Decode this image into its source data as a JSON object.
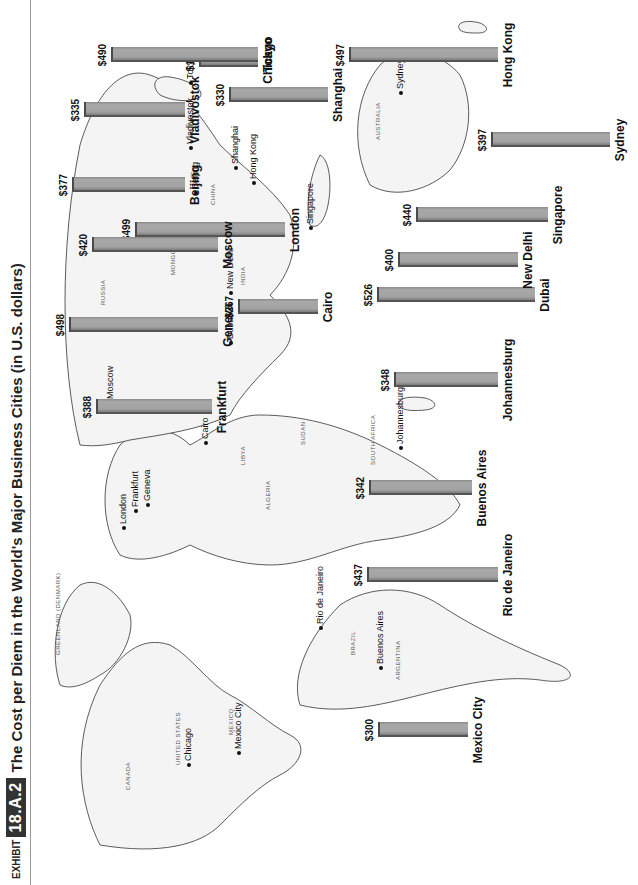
{
  "header": {
    "exhibit_prefix": "EXHIBIT",
    "exhibit_number": "18.A.2",
    "title": "The Cost per Diem in the World's Major Business Cities (in U.S. dollars)"
  },
  "chart_data": {
    "type": "bar",
    "title": "The Cost per Diem in the World's Major Business Cities (in U.S. dollars)",
    "xlabel": "",
    "ylabel": "Cost per diem (US$)",
    "categories": [
      "Chicago",
      "Mexico City",
      "London",
      "Rio de Janeiro",
      "Cairo",
      "Buenos Aires",
      "Frankfurt",
      "Johannesburg",
      "Geneva",
      "Dubai",
      "Moscow",
      "New Delhi",
      "Beijing",
      "Singapore",
      "Vladivostok",
      "Shanghai",
      "Tokyo",
      "Hong Kong",
      "Sydney"
    ],
    "values": [
      198,
      300,
      499,
      437,
      267,
      342,
      388,
      348,
      498,
      526,
      420,
      400,
      377,
      440,
      335,
      330,
      490,
      497,
      397
    ],
    "value_labels": [
      "$198",
      "$300",
      "$499",
      "$437",
      "$267",
      "$342",
      "$388",
      "$348",
      "$498",
      "$526",
      "$420",
      "$400",
      "$377",
      "$440",
      "$335",
      "$330",
      "$490",
      "$497",
      "$397"
    ],
    "background": "world map",
    "grid": false,
    "legend": null
  },
  "bars": [
    {
      "city": "Chicago",
      "label": "$198",
      "value": 198,
      "x": 825,
      "base": 258,
      "row": "upper"
    },
    {
      "city": "Mexico City",
      "label": "$300",
      "value": 300,
      "x": 155,
      "base": 468,
      "row": "lower"
    },
    {
      "city": "London",
      "label": "$499",
      "value": 499,
      "x": 655,
      "base": 285,
      "row": "upper"
    },
    {
      "city": "Rio de Janeiro",
      "label": "$437",
      "value": 437,
      "x": 310,
      "base": 498,
      "row": "lower"
    },
    {
      "city": "Cairo",
      "label": "$267",
      "value": 267,
      "x": 578,
      "base": 318,
      "row": "upper"
    },
    {
      "city": "Buenos Aires",
      "label": "$342",
      "value": 342,
      "x": 397,
      "base": 472,
      "row": "lower"
    },
    {
      "city": "Frankfurt",
      "label": "$388",
      "value": 388,
      "x": 478,
      "base": 212,
      "row": "upper"
    },
    {
      "city": "Johannesburg",
      "label": "$348",
      "value": 348,
      "x": 505,
      "base": 498,
      "row": "lower"
    },
    {
      "city": "Geneva",
      "label": "$498",
      "value": 498,
      "x": 560,
      "base": 218,
      "row": "upper"
    },
    {
      "city": "Dubai",
      "label": "$526",
      "value": 526,
      "x": 590,
      "base": 535,
      "row": "lower"
    },
    {
      "city": "Moscow",
      "label": "$420",
      "value": 420,
      "x": 640,
      "base": 218,
      "row": "upper"
    },
    {
      "city": "New Delhi",
      "label": "$400",
      "value": 400,
      "x": 625,
      "base": 518,
      "row": "lower"
    },
    {
      "city": "Beijing",
      "label": "$377",
      "value": 377,
      "x": 700,
      "base": 185,
      "row": "upper"
    },
    {
      "city": "Singapore",
      "label": "$440",
      "value": 440,
      "x": 670,
      "base": 548,
      "row": "lower"
    },
    {
      "city": "Vladivostok",
      "label": "$335",
      "value": 335,
      "x": 775,
      "base": 185,
      "row": "upper"
    },
    {
      "city": "Shanghai",
      "label": "$330",
      "value": 330,
      "x": 790,
      "base": 328,
      "row": "upper"
    },
    {
      "city": "Tokyo",
      "label": "$490",
      "value": 490,
      "x": 830,
      "base": 258,
      "row": "upper"
    },
    {
      "city": "Hong Kong",
      "label": "$497",
      "value": 497,
      "x": 830,
      "base": 498,
      "row": "lower"
    },
    {
      "city": "Sydney",
      "label": "$397",
      "value": 397,
      "x": 745,
      "base": 610,
      "row": "lower"
    }
  ],
  "map_city_markers": [
    "Chicago",
    "Mexico City",
    "London",
    "Frankfurt",
    "Geneva",
    "Moscow",
    "Cairo",
    "Dubai",
    "Johannesburg",
    "New Delhi",
    "Beijing",
    "Vladivostok",
    "Tokyo",
    "Shanghai",
    "Hong Kong",
    "Singapore",
    "Sydney",
    "Rio de Janeiro",
    "Buenos Aires"
  ],
  "map_country_labels": [
    "CANADA",
    "UNITED STATES",
    "MEXICO",
    "CUBA",
    "GREENLAND (DENMARK)",
    "ICELAND",
    "BRAZIL",
    "PERU",
    "BOLIVIA",
    "ARGENTINA",
    "CHILE",
    "ECUADOR",
    "COLOMBIA",
    "VENEZUELA",
    "GUYANA",
    "SURINAME",
    "FRENCH GUIANA",
    "RUSSIA",
    "MONGOLIA",
    "CHINA",
    "INDIA",
    "KAZAKHSTAN",
    "AUSTRALIA",
    "NEW ZEALAND",
    "PAPUA NEW GUINEA",
    "PHILIPPINES",
    "ALGERIA",
    "LIBYA",
    "EGYPT",
    "SUDAN",
    "CHAD",
    "NIGER",
    "MALI",
    "ETHIOPIA",
    "SOUTH AFRICA",
    "NAMIBIA",
    "ANGOLA",
    "MADAGASCAR",
    "SAUDI ARABIA",
    "IRAN"
  ]
}
